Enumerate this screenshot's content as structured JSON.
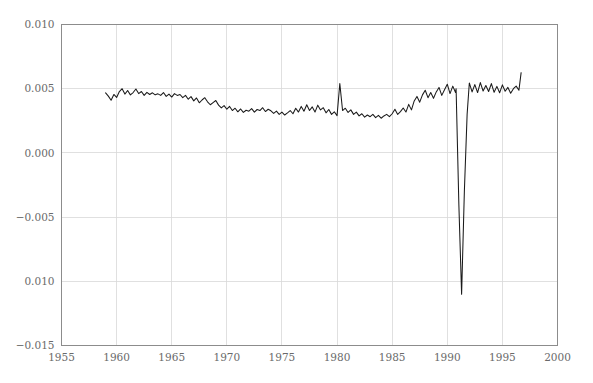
{
  "chart_data": {
    "type": "line",
    "title": "",
    "subtitle": "",
    "xlabel": "",
    "ylabel": "",
    "xlim": [
      1955,
      2000
    ],
    "ylim": [
      -0.015,
      0.01
    ],
    "grid": true,
    "legend": null,
    "legend_position": "none",
    "line_color": "#1a1a1a",
    "frame_color": "#8c8c8c",
    "grid_color": "#d8d8d8",
    "background_color": "#ffffff",
    "xticks": [
      1955,
      1960,
      1965,
      1970,
      1975,
      1980,
      1985,
      1990,
      1995,
      2000
    ],
    "xtick_labels": [
      "1955",
      "1960",
      "1965",
      "1970",
      "1975",
      "1980",
      "1985",
      "1990",
      "1995",
      "2000"
    ],
    "yticks": [
      0.01,
      0.005,
      0.0,
      -0.005,
      -0.01,
      -0.015
    ],
    "ytick_labels": [
      "0.010",
      "0.005",
      "0.000",
      "−0.005",
      "0.010",
      "−0.015"
    ],
    "annotations": [
      {
        "text": "sharp negative spike",
        "x": 1991.0,
        "y": -0.011
      }
    ],
    "series": [
      {
        "name": "series-1",
        "color": "#1a1a1a",
        "x": [
          1959.0,
          1959.25,
          1959.5,
          1959.75,
          1960.0,
          1960.25,
          1960.5,
          1960.75,
          1961.0,
          1961.25,
          1961.5,
          1961.75,
          1962.0,
          1962.25,
          1962.5,
          1962.75,
          1963.0,
          1963.25,
          1963.5,
          1963.75,
          1964.0,
          1964.25,
          1964.5,
          1964.75,
          1965.0,
          1965.25,
          1965.5,
          1965.75,
          1966.0,
          1966.25,
          1966.5,
          1966.75,
          1967.0,
          1967.25,
          1967.5,
          1967.75,
          1968.0,
          1968.25,
          1968.5,
          1968.75,
          1969.0,
          1969.25,
          1969.5,
          1969.75,
          1970.0,
          1970.25,
          1970.5,
          1970.75,
          1971.0,
          1971.25,
          1971.5,
          1971.75,
          1972.0,
          1972.25,
          1972.5,
          1972.75,
          1973.0,
          1973.25,
          1973.5,
          1973.75,
          1974.0,
          1974.25,
          1974.5,
          1974.75,
          1975.0,
          1975.25,
          1975.5,
          1975.75,
          1976.0,
          1976.25,
          1976.5,
          1976.75,
          1977.0,
          1977.25,
          1977.5,
          1977.75,
          1978.0,
          1978.25,
          1978.5,
          1978.75,
          1979.0,
          1979.25,
          1979.5,
          1979.75,
          1980.0,
          1980.25,
          1980.5,
          1980.75,
          1981.0,
          1981.25,
          1981.5,
          1981.75,
          1982.0,
          1982.25,
          1982.5,
          1982.75,
          1983.0,
          1983.25,
          1983.5,
          1983.75,
          1984.0,
          1984.25,
          1984.5,
          1984.75,
          1985.0,
          1985.25,
          1985.5,
          1985.75,
          1986.0,
          1986.25,
          1986.5,
          1986.75,
          1987.0,
          1987.25,
          1987.5,
          1987.75,
          1988.0,
          1988.25,
          1988.5,
          1988.75,
          1989.0,
          1989.25,
          1989.5,
          1989.75,
          1990.0,
          1990.25,
          1990.5,
          1990.75,
          1991.0,
          1991.25,
          1991.5,
          1991.75,
          1992.0,
          1992.25,
          1992.5,
          1992.75,
          1993.0,
          1993.25,
          1993.5,
          1993.75,
          1994.0,
          1994.25,
          1994.5,
          1994.75,
          1995.0,
          1995.25,
          1995.5,
          1995.75,
          1996.0,
          1996.25,
          1996.5,
          1996.7
        ],
        "y": [
          0.00468,
          0.00442,
          0.0041,
          0.00455,
          0.00432,
          0.00478,
          0.005,
          0.00458,
          0.00486,
          0.00452,
          0.0047,
          0.00498,
          0.00462,
          0.00478,
          0.00448,
          0.00472,
          0.00455,
          0.00468,
          0.00452,
          0.0046,
          0.00448,
          0.0047,
          0.0044,
          0.00458,
          0.00435,
          0.00462,
          0.00448,
          0.00455,
          0.0043,
          0.00448,
          0.00418,
          0.00438,
          0.00405,
          0.00428,
          0.0039,
          0.00412,
          0.0043,
          0.00398,
          0.00375,
          0.00392,
          0.00408,
          0.00372,
          0.0035,
          0.00368,
          0.0034,
          0.00362,
          0.0033,
          0.00348,
          0.0032,
          0.00342,
          0.00315,
          0.00332,
          0.00325,
          0.00345,
          0.00318,
          0.00338,
          0.0033,
          0.00352,
          0.00322,
          0.0034,
          0.00328,
          0.00308,
          0.00325,
          0.003,
          0.00318,
          0.00295,
          0.00312,
          0.0033,
          0.00305,
          0.00348,
          0.00318,
          0.00362,
          0.00325,
          0.00375,
          0.0033,
          0.00358,
          0.00318,
          0.00372,
          0.00335,
          0.00352,
          0.00312,
          0.00338,
          0.003,
          0.0032,
          0.0029,
          0.0054,
          0.0033,
          0.00348,
          0.00315,
          0.00335,
          0.003,
          0.00318,
          0.00288,
          0.00305,
          0.00278,
          0.00295,
          0.00282,
          0.003,
          0.00275,
          0.00292,
          0.0027,
          0.00288,
          0.003,
          0.00282,
          0.00305,
          0.0034,
          0.003,
          0.00322,
          0.0035,
          0.00318,
          0.00378,
          0.00335,
          0.00405,
          0.0044,
          0.00395,
          0.00452,
          0.00488,
          0.0043,
          0.0047,
          0.00425,
          0.00475,
          0.0051,
          0.00448,
          0.00492,
          0.00535,
          0.00462,
          0.0052,
          0.0047,
          0.00555,
          0.00478,
          0.00528,
          0.00482,
          0.00545,
          0.00475,
          0.00532,
          0.0047,
          0.00548,
          0.00482,
          0.00525,
          0.00478,
          0.0054,
          0.00472,
          0.00518,
          0.00468,
          0.0053,
          0.0048,
          0.0051,
          0.00465,
          0.005,
          0.0052,
          0.00488,
          0.00625
        ]
      }
    ],
    "series_notes": {
      "crash_event": {
        "label": "1991 collapse",
        "x_points": [
          1990.8,
          1991.05,
          1991.3,
          1991.55,
          1991.8
        ],
        "y_points": [
          0.005,
          -0.004,
          -0.011,
          -0.003,
          0.003
        ]
      }
    }
  },
  "axis": {
    "y_labels": [
      "0.010",
      "0.005",
      "0.000",
      "−0.005",
      "0.010",
      "−0.015"
    ],
    "x_labels": [
      "1955",
      "1960",
      "1965",
      "1970",
      "1975",
      "1980",
      "1985",
      "1990",
      "1995",
      "2000"
    ]
  }
}
